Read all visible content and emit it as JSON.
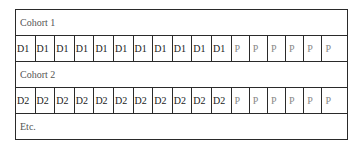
{
  "diagram": {
    "rows": [
      {
        "type": "label",
        "text": "Cohort 1"
      },
      {
        "type": "cells",
        "cells": [
          "D1",
          "D1",
          "D1",
          "D1",
          "D1",
          "D1",
          "D1",
          "D1",
          "D1",
          "D1",
          "D1",
          "P",
          "P",
          "P",
          "P",
          "P",
          "P"
        ]
      },
      {
        "type": "label",
        "text": "Cohort 2"
      },
      {
        "type": "cells",
        "cells": [
          "D2",
          "D2",
          "D2",
          "D2",
          "D2",
          "D2",
          "D2",
          "D2",
          "D2",
          "D2",
          "D2",
          "P",
          "P",
          "P",
          "P",
          "P",
          "P"
        ]
      },
      {
        "type": "label",
        "text": "Etc."
      }
    ],
    "colors": {
      "border": "#2a2a2a",
      "d_text": "#1a1a1a",
      "p_text": "#888888",
      "label_text": "#555555"
    }
  }
}
